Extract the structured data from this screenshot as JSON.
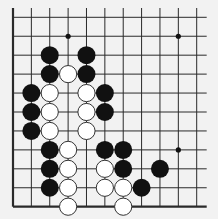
{
  "board": {
    "type": "go-board-fragment",
    "columns": 11,
    "rows": 11,
    "edges": {
      "left": true,
      "bottom": true,
      "top": false,
      "right": false
    },
    "colors": {
      "background": "#f2f2f2",
      "line": "#2a2a2a",
      "black_stone": "#111111",
      "white_stone": "#ffffff",
      "white_outline": "#333333"
    },
    "star_points": [
      [
        3,
        1
      ],
      [
        9,
        1
      ],
      [
        9,
        7
      ]
    ],
    "black_stones": [
      [
        2,
        2
      ],
      [
        4,
        2
      ],
      [
        2,
        3
      ],
      [
        4,
        3
      ],
      [
        1,
        4
      ],
      [
        5,
        4
      ],
      [
        1,
        5
      ],
      [
        5,
        5
      ],
      [
        1,
        6
      ],
      [
        2,
        7
      ],
      [
        5,
        7
      ],
      [
        6,
        7
      ],
      [
        2,
        8
      ],
      [
        6,
        8
      ],
      [
        8,
        8
      ],
      [
        2,
        9
      ],
      [
        7,
        9
      ]
    ],
    "white_stones": [
      [
        3,
        3
      ],
      [
        2,
        4
      ],
      [
        4,
        4
      ],
      [
        2,
        5
      ],
      [
        4,
        5
      ],
      [
        2,
        6
      ],
      [
        4,
        6
      ],
      [
        3,
        7
      ],
      [
        3,
        8
      ],
      [
        5,
        8
      ],
      [
        3,
        9
      ],
      [
        5,
        9
      ],
      [
        6,
        9
      ],
      [
        3,
        10
      ],
      [
        6,
        10
      ]
    ]
  }
}
